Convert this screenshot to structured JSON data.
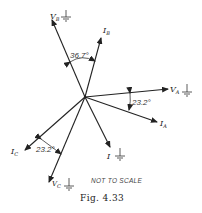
{
  "figure": {
    "caption": "Fig. 4.33",
    "note": "NOT TO SCALE",
    "phasors": [
      {
        "name": "V_B",
        "label_main": "V",
        "label_sub": "B",
        "grounded": true
      },
      {
        "name": "I_B",
        "label_main": "I",
        "label_sub": "B",
        "grounded": false
      },
      {
        "name": "V_A",
        "label_main": "V",
        "label_sub": "A",
        "grounded": true
      },
      {
        "name": "I_A",
        "label_main": "I",
        "label_sub": "A",
        "grounded": false
      },
      {
        "name": "I",
        "label_main": "I",
        "label_sub": "",
        "grounded": true
      },
      {
        "name": "I_C",
        "label_main": "I",
        "label_sub": "C",
        "grounded": false
      },
      {
        "name": "V_C",
        "label_main": "V",
        "label_sub": "C",
        "grounded": true
      }
    ],
    "angles": [
      {
        "between": [
          "V_B",
          "I_B"
        ],
        "label": "36.7°"
      },
      {
        "between": [
          "V_A",
          "I_A"
        ],
        "label": "23.2°"
      },
      {
        "between": [
          "I_C",
          "V_C"
        ],
        "label": "23.2°"
      }
    ]
  }
}
